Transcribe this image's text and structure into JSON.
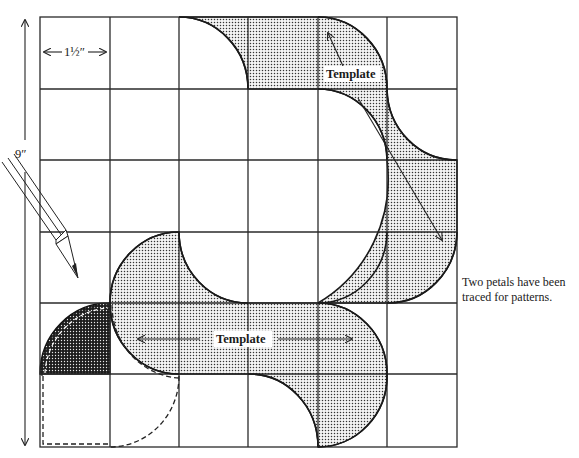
{
  "figure": {
    "type": "pattern-drafting-diagram",
    "grid": {
      "columns": 6,
      "rows": 6
    },
    "dimensions": {
      "cell_width_label": "1½″",
      "total_height_label": "9″"
    },
    "labels": {
      "template_top": "Template",
      "template_middle": "Template"
    },
    "note": {
      "line1": "Two petals have been",
      "line2": "traced for patterns."
    },
    "colors": {
      "line": "#1a1a1a",
      "shading_dot": "#333333",
      "background": "#ffffff"
    }
  }
}
